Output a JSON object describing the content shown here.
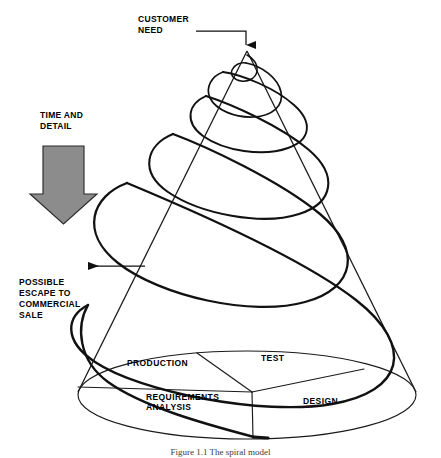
{
  "figure": {
    "caption": "Figure 1.1   The spiral model",
    "apex_label": "CUSTOMER\nNEED",
    "time_label": "TIME AND\nDETAIL",
    "escape_label": "POSSIBLE\nESCAPE TO\nCOMMERCIAL\nSALE",
    "sectors": [
      {
        "name": "production",
        "label": "PRODUCTION"
      },
      {
        "name": "test",
        "label": "TEST"
      },
      {
        "name": "design",
        "label": "DESIGN"
      },
      {
        "name": "requirements",
        "label": "REQUIREMENTS\nANALYSIS"
      }
    ],
    "colors": {
      "line": "#1a1a1a",
      "spiral": "#111111",
      "arrow_fill": "#8c8c8c",
      "arrow_stroke": "#2b2b2b",
      "background": "#ffffff",
      "text": "#000000",
      "caption_text": "#3c3c3c"
    },
    "geometry": {
      "apex_x": 247,
      "apex_y": 51,
      "base_center_x": 247,
      "base_center_y": 395,
      "base_rx": 169,
      "base_ry": 44,
      "hub_x": 252,
      "hub_y": 392
    }
  }
}
